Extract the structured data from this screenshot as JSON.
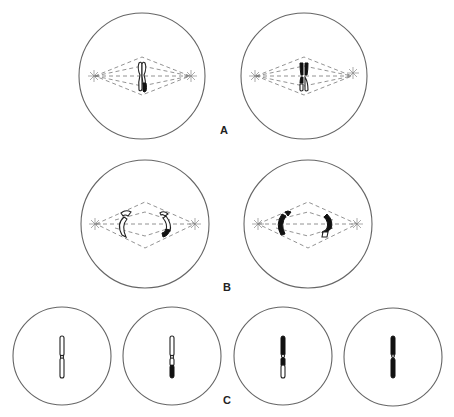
{
  "figure": {
    "panels": [
      {
        "id": "A",
        "label": "A",
        "description": "Two cells in metaphase with a single chromosome (two chromatids) on the spindle; left shows one dark segment at lower end, right shows dark upper arms"
      },
      {
        "id": "B",
        "label": "B",
        "description": "Two cells in anaphase with chromatids separating toward spindle poles; left mostly open, right mostly dark"
      },
      {
        "id": "C",
        "label": "C",
        "description": "Four daughter cells each containing one chromatid with varying dark/light segments"
      }
    ],
    "colors": {
      "outline": "#666666",
      "spindle": "#777777",
      "chromatid_dark": "#111111",
      "chromatid_light": "#ffffff",
      "background": "#ffffff"
    }
  },
  "labels": {
    "a": "A",
    "b": "B",
    "c": "C"
  }
}
